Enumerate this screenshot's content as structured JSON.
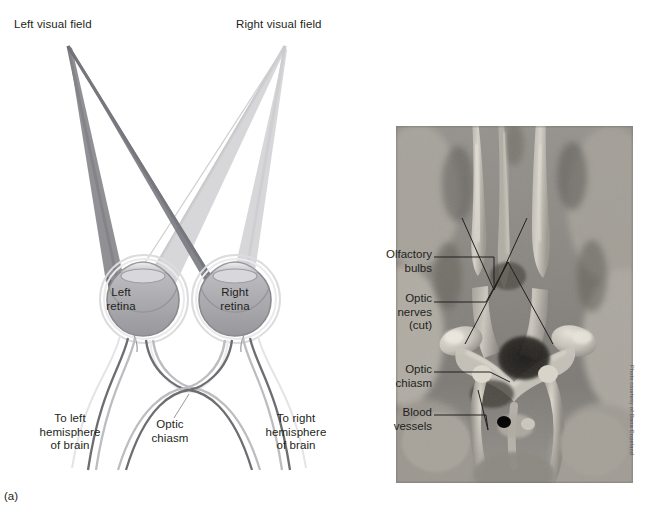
{
  "figure": {
    "panels": [
      {
        "tag": "(a)",
        "kind": "diagram"
      },
      {
        "tag": "(b)",
        "kind": "photograph"
      }
    ],
    "credit": "Photo courtesy of Dana Copeland"
  },
  "diagram": {
    "labels": {
      "left_visual_field": "Left visual field",
      "right_visual_field": "Right visual field",
      "left_retina": "Left\nretina",
      "right_retina": "Right\nretina",
      "to_left_hemisphere": "To left\nhemisphere\nof brain",
      "optic_chiasm": "Optic\nchiasm",
      "to_right_hemisphere": "To right\nhemisphere\nof brain"
    },
    "colors": {
      "left_field_ray": "#6f6f72",
      "right_field_ray": "#c9c9cb",
      "eye_outline": "#8a8a8d",
      "eye_fill": "#a9a9ad",
      "nerve_dark": "#6e6e72",
      "nerve_light": "#c6c6c8",
      "text": "#231f20"
    }
  },
  "photo": {
    "labels": [
      {
        "id": "olfactory-bulbs",
        "text": "Olfactory\nbulbs"
      },
      {
        "id": "optic-nerves-cut",
        "text": "Optic\nnerves\n(cut)"
      },
      {
        "id": "optic-chiasm",
        "text": "Optic\nchiasm"
      },
      {
        "id": "blood-vessels",
        "text": "Blood\nvessels"
      }
    ]
  }
}
